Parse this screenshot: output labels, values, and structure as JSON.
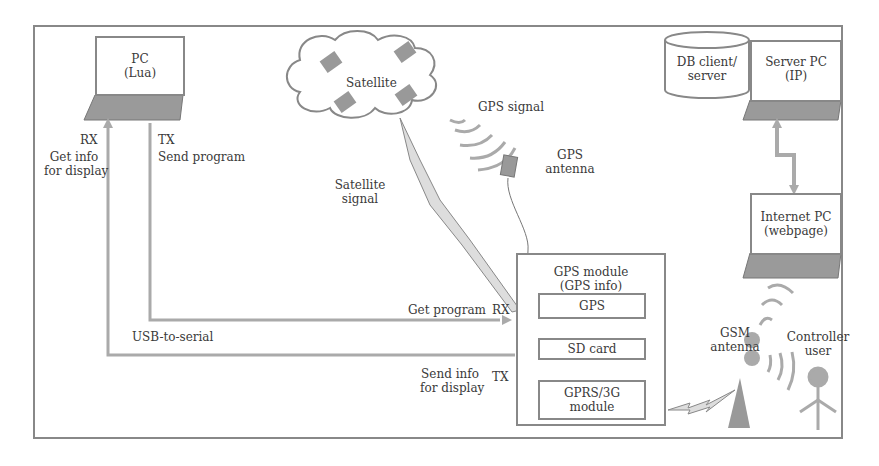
{
  "diagram": {
    "pc": {
      "line1": "PC",
      "line2": "(Lua)"
    },
    "rx_pc": "RX",
    "tx_pc": "TX",
    "get_info_1": "Get info",
    "get_info_2": "for display",
    "send_program": "Send program",
    "satellite": "Satellite",
    "gps_signal": "GPS signal",
    "gps_antenna_1": "GPS",
    "gps_antenna_2": "antenna",
    "sat_signal_1": "Satellite",
    "sat_signal_2": "signal",
    "db_1": "DB client/",
    "db_2": "server",
    "server_pc_1": "Server PC",
    "server_pc_2": "(IP)",
    "internet_pc_1": "Internet PC",
    "internet_pc_2": "(webpage)",
    "gps_module_1": "GPS module",
    "gps_module_2": "(GPS info)",
    "gps_box": "GPS",
    "sd_card": "SD card",
    "gprs_1": "GPRS/3G",
    "gprs_2": "module",
    "get_program": "Get program",
    "rx_mod": "RX",
    "usb_serial": "USB-to-serial",
    "send_info_1": "Send info",
    "send_info_2": "for display",
    "tx_mod": "TX",
    "gsm_1": "GSM",
    "gsm_2": "antenna",
    "controller_1": "Controller",
    "controller_2": "user"
  }
}
